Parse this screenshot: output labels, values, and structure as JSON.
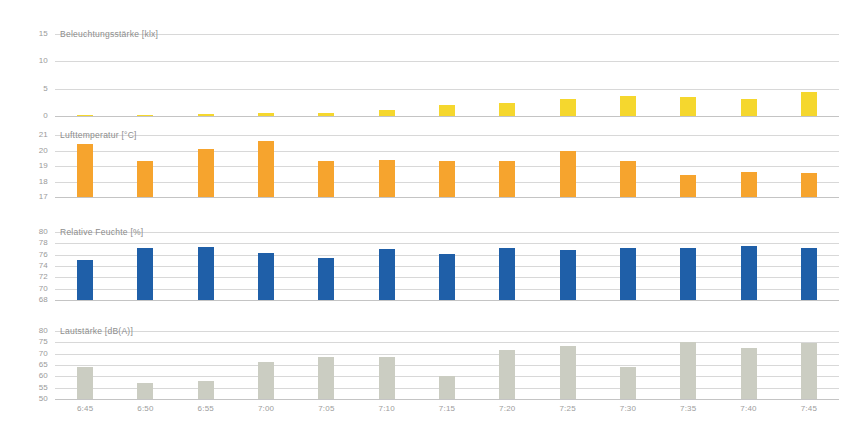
{
  "chart_data": {
    "type": "bar",
    "title": "",
    "layout": "four stacked bar panels sharing one time axis",
    "xlabel": "",
    "categories": [
      "6:45",
      "6:50",
      "6:55",
      "7:00",
      "7:05",
      "7:10",
      "7:15",
      "7:20",
      "7:25",
      "7:30",
      "7:35",
      "7:40",
      "7:45"
    ],
    "grid": true,
    "legend": "none",
    "panels": [
      {
        "name": "illuminance",
        "ylabel": "Beleuchtungsstärke [klx]",
        "ylim": [
          0,
          15
        ],
        "yticks": [
          15,
          10,
          5,
          0
        ],
        "color": "#F5D72E",
        "values": [
          0.2,
          0.25,
          0.35,
          0.5,
          0.6,
          1.1,
          2.0,
          2.3,
          3.2,
          3.7,
          3.4,
          3.1,
          4.4
        ]
      },
      {
        "name": "air-temperature",
        "ylabel": "Lufttemperatur [°C]",
        "ylim": [
          17,
          21
        ],
        "yticks": [
          21,
          20,
          19,
          18,
          17
        ],
        "color": "#F6A42E",
        "values": [
          20.4,
          19.3,
          20.1,
          20.6,
          19.3,
          19.4,
          19.3,
          19.3,
          20.0,
          19.3,
          18.4,
          18.6,
          18.55
        ]
      },
      {
        "name": "relative-humidity",
        "ylabel": "Relative Feuchte [%]",
        "ylim": [
          68,
          80
        ],
        "yticks": [
          80,
          78,
          76,
          74,
          72,
          70,
          68
        ],
        "color": "#1F5FA8",
        "values": [
          75.0,
          77.1,
          77.3,
          76.3,
          75.5,
          77.0,
          76.2,
          77.1,
          76.8,
          77.2,
          77.1,
          77.5,
          77.2
        ]
      },
      {
        "name": "sound-level",
        "ylabel": "Lautstärke [dB(A)]",
        "ylim": [
          50,
          80
        ],
        "yticks": [
          80,
          75,
          70,
          65,
          60,
          55,
          50
        ],
        "color": "#CBCDC2",
        "values": [
          64.0,
          57.0,
          58.0,
          66.5,
          68.5,
          68.5,
          60.0,
          71.5,
          73.5,
          64.0,
          75.0,
          72.5,
          74.5
        ]
      }
    ]
  }
}
